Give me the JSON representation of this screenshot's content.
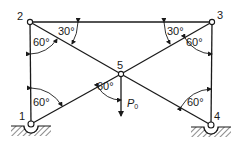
{
  "figure": {
    "type": "truss diagram",
    "stroke_color": "#1a1a1a",
    "background": "#ffffff"
  },
  "nodes": [
    {
      "id": "1",
      "label": "1",
      "x": 31,
      "y": 124,
      "support": "pin"
    },
    {
      "id": "2",
      "label": "2",
      "x": 30,
      "y": 22,
      "support": "none"
    },
    {
      "id": "3",
      "label": "3",
      "x": 212,
      "y": 22,
      "support": "none"
    },
    {
      "id": "4",
      "label": "4",
      "x": 211,
      "y": 125,
      "support": "pin"
    },
    {
      "id": "5",
      "label": "5",
      "x": 121,
      "y": 74,
      "support": "none"
    }
  ],
  "members": [
    {
      "from": "1",
      "to": "2"
    },
    {
      "from": "2",
      "to": "3"
    },
    {
      "from": "3",
      "to": "4"
    },
    {
      "from": "2",
      "to": "5"
    },
    {
      "from": "5",
      "to": "4"
    },
    {
      "from": "1",
      "to": "5"
    },
    {
      "from": "5",
      "to": "3"
    }
  ],
  "angles": [
    {
      "name": "angle-2-vertical",
      "label": "60°",
      "x": 33,
      "y": 37
    },
    {
      "name": "angle-2-horizontal",
      "label": "30°",
      "x": 58,
      "y": 26
    },
    {
      "name": "angle-3-horizontal",
      "label": "30°",
      "x": 168,
      "y": 26
    },
    {
      "name": "angle-3-vertical",
      "label": "60°",
      "x": 186,
      "y": 37
    },
    {
      "name": "angle-1",
      "label": "60°",
      "x": 33,
      "y": 97
    },
    {
      "name": "angle-5",
      "label": "60°",
      "x": 97,
      "y": 81
    },
    {
      "name": "angle-4",
      "label": "60°",
      "x": 187,
      "y": 97
    }
  ],
  "load": {
    "label": "P",
    "subscript": "0",
    "at_node": "5",
    "arrow_end_y": 116,
    "label_x": 127,
    "label_y": 98
  },
  "node_labels": [
    {
      "id": "1",
      "text": "1",
      "x": 19,
      "y": 111
    },
    {
      "id": "2",
      "text": "2",
      "x": 17,
      "y": 11
    },
    {
      "id": "3",
      "text": "3",
      "x": 217,
      "y": 10
    },
    {
      "id": "4",
      "text": "4",
      "x": 214,
      "y": 111
    },
    {
      "id": "5",
      "text": "5",
      "x": 117,
      "y": 60
    }
  ]
}
